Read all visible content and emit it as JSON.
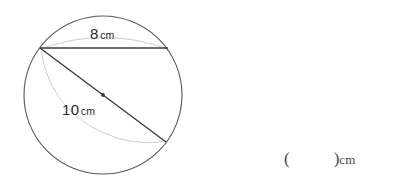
{
  "figure": {
    "type": "circle-with-chord-and-diameter",
    "circle": {
      "center_x": 103,
      "center_y": 95,
      "radius": 79,
      "stroke_color": "#585858"
    },
    "chord": {
      "x1": 40,
      "y1": 48,
      "x2": 168,
      "y2": 48,
      "stroke_color": "#3c3c3c",
      "measure_value": "8",
      "measure_unit": "cm"
    },
    "diameter": {
      "x1": 40,
      "y1": 48,
      "x2": 166,
      "y2": 142,
      "stroke_color": "#3c3c3c",
      "measure_value": "10",
      "measure_unit": "cm"
    },
    "center_dot": {
      "cx": 103,
      "cy": 95,
      "r": 1.8,
      "fill_color": "#3c3c3c"
    },
    "construction_arcs": {
      "stroke_color": "#c9c9c9",
      "top_arc_note": "faint arc bulging above the 8 cm chord",
      "lower_arc_note": "faint arc from chord left endpoint curving down to the diameter endpoint"
    }
  },
  "answer": {
    "open_paren": "(",
    "close_paren": ")",
    "unit": "cm"
  }
}
